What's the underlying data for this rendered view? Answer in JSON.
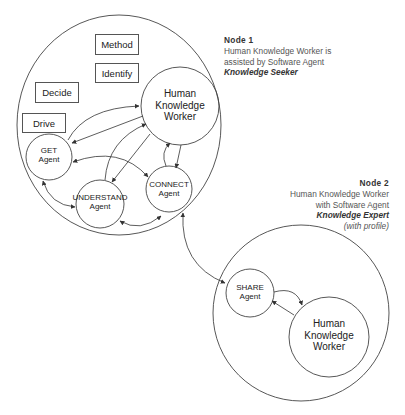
{
  "node1": {
    "title": "Node 1",
    "line1": "Human Knowledge Worker is",
    "line2": "assisted by Software Agent",
    "role": "Knowledge Seeker",
    "boxes": [
      "Method",
      "Identify",
      "Decide",
      "Drive"
    ],
    "hkw": [
      "Human",
      "Knowledge",
      "Worker"
    ],
    "agents": {
      "get": [
        "GET",
        "Agent"
      ],
      "understand": [
        "UNDERSTAND",
        "Agent"
      ],
      "connect": [
        "CONNECT",
        "Agent"
      ]
    }
  },
  "node2": {
    "title": "Node 2",
    "line1": "Human Knowledge Worker",
    "line2": "with Software Agent",
    "role": "Knowledge Expert",
    "profile": "(with profile)",
    "hkw": [
      "Human",
      "Knowledge",
      "Worker"
    ],
    "agents": {
      "share": [
        "SHARE",
        "Agent"
      ]
    }
  },
  "colors": {
    "stroke": "#444444",
    "text": "#222222",
    "note_text": "#555555",
    "background": "#ffffff"
  }
}
